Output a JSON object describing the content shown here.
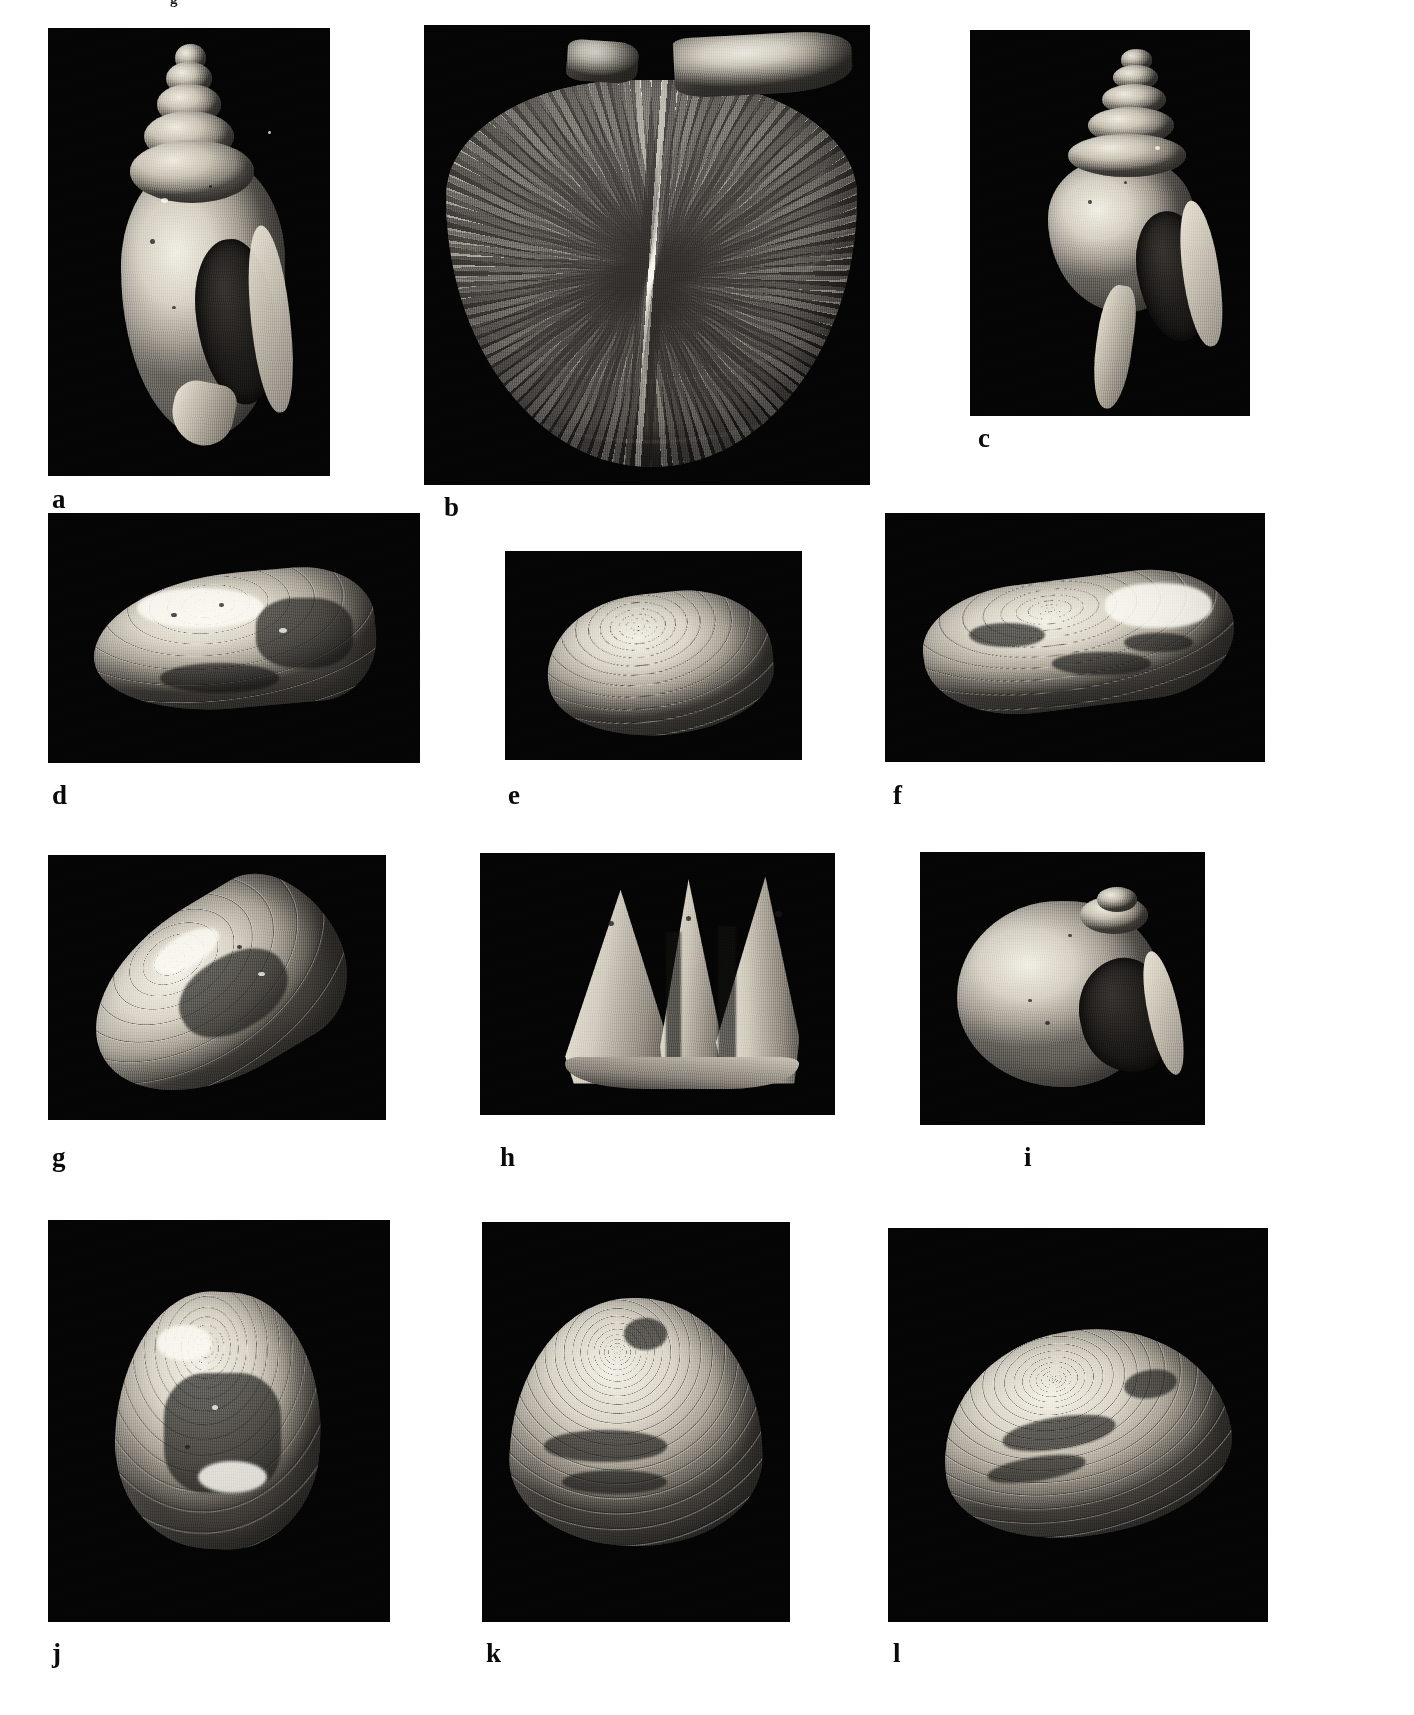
{
  "figure": {
    "type": "scientific-plate",
    "title_fragment": "g",
    "background_color": "#ffffff",
    "panel_background_color": "#050505",
    "label_color": "#0a0a0a",
    "panel_count": 12,
    "columns": 3,
    "rows": 4
  },
  "panels": [
    {
      "label": "a",
      "row": 1,
      "column": 1,
      "subject": "high-spired gastropod shell, apertural view",
      "shell_type": "gastropod",
      "orientation": "vertical",
      "aperture": "dark ovate aperture at lower right",
      "rect": {
        "x": 48,
        "y": 28,
        "w": 282,
        "h": 448
      },
      "label_pos": {
        "x": 52,
        "y": 486
      }
    },
    {
      "label": "b",
      "row": 1,
      "column": 2,
      "subject": "large scallop valve with radiating ribs and auricle",
      "shell_type": "bivalve-scallop",
      "orientation": "fan",
      "rect": {
        "x": 424,
        "y": 25,
        "w": 446,
        "h": 460
      },
      "label_pos": {
        "x": 444,
        "y": 494
      }
    },
    {
      "label": "c",
      "row": 1,
      "column": 3,
      "subject": "spired whelk-like gastropod with long siphonal canal",
      "shell_type": "gastropod",
      "orientation": "vertical",
      "rect": {
        "x": 970,
        "y": 30,
        "w": 280,
        "h": 386
      },
      "label_pos": {
        "x": 978,
        "y": 425
      }
    },
    {
      "label": "d",
      "row": 2,
      "column": 1,
      "subject": "elongate mussel-like bivalve, left valve exterior",
      "shell_type": "bivalve-mytilid",
      "orientation": "horizontal",
      "rect": {
        "x": 48,
        "y": 513,
        "w": 372,
        "h": 250
      },
      "label_pos": {
        "x": 52,
        "y": 782
      }
    },
    {
      "label": "e",
      "row": 2,
      "column": 2,
      "subject": "ribbed venerid clam valve with concentric ribs",
      "shell_type": "bivalve-venerid",
      "orientation": "oblique",
      "rect": {
        "x": 505,
        "y": 551,
        "w": 297,
        "h": 209
      },
      "label_pos": {
        "x": 508,
        "y": 782
      }
    },
    {
      "label": "f",
      "row": 2,
      "column": 3,
      "subject": "oyster-like bivalve with irregular concentric lamellae",
      "shell_type": "bivalve-ostreid",
      "orientation": "horizontal",
      "rect": {
        "x": 885,
        "y": 513,
        "w": 380,
        "h": 249
      },
      "label_pos": {
        "x": 893,
        "y": 782
      }
    },
    {
      "label": "g",
      "row": 3,
      "column": 1,
      "subject": "elongate mussel valve, oblique view",
      "shell_type": "bivalve-mytilid",
      "orientation": "diagonal",
      "rect": {
        "x": 48,
        "y": 855,
        "w": 338,
        "h": 265
      },
      "label_pos": {
        "x": 52,
        "y": 1144
      }
    },
    {
      "label": "h",
      "row": 3,
      "column": 2,
      "subject": "three tall conical shell plates in cluster",
      "shell_type": "conical-plates",
      "orientation": "upright cluster",
      "rect": {
        "x": 480,
        "y": 853,
        "w": 355,
        "h": 262
      },
      "label_pos": {
        "x": 500,
        "y": 1144
      }
    },
    {
      "label": "i",
      "row": 3,
      "column": 3,
      "subject": "globose naticid moon snail with large dark aperture",
      "shell_type": "gastropod-naticid",
      "orientation": "apertural",
      "rect": {
        "x": 920,
        "y": 852,
        "w": 285,
        "h": 273
      },
      "label_pos": {
        "x": 1024,
        "y": 1144
      }
    },
    {
      "label": "j",
      "row": 4,
      "column": 1,
      "subject": "trigonal clam valve with concentric growth lines",
      "shell_type": "bivalve",
      "orientation": "upright",
      "rect": {
        "x": 48,
        "y": 1220,
        "w": 342,
        "h": 402
      },
      "label_pos": {
        "x": 52,
        "y": 1640
      }
    },
    {
      "label": "k",
      "row": 4,
      "column": 2,
      "subject": "broad clam valve with dense concentric growth ridges",
      "shell_type": "bivalve",
      "orientation": "wide",
      "rect": {
        "x": 482,
        "y": 1222,
        "w": 308,
        "h": 400
      },
      "label_pos": {
        "x": 486,
        "y": 1640
      }
    },
    {
      "label": "l",
      "row": 4,
      "column": 3,
      "subject": "oblique clam valve with concentric ridges and dark staining",
      "shell_type": "bivalve",
      "orientation": "oblique",
      "rect": {
        "x": 888,
        "y": 1228,
        "w": 380,
        "h": 394
      },
      "label_pos": {
        "x": 893,
        "y": 1640
      }
    }
  ]
}
